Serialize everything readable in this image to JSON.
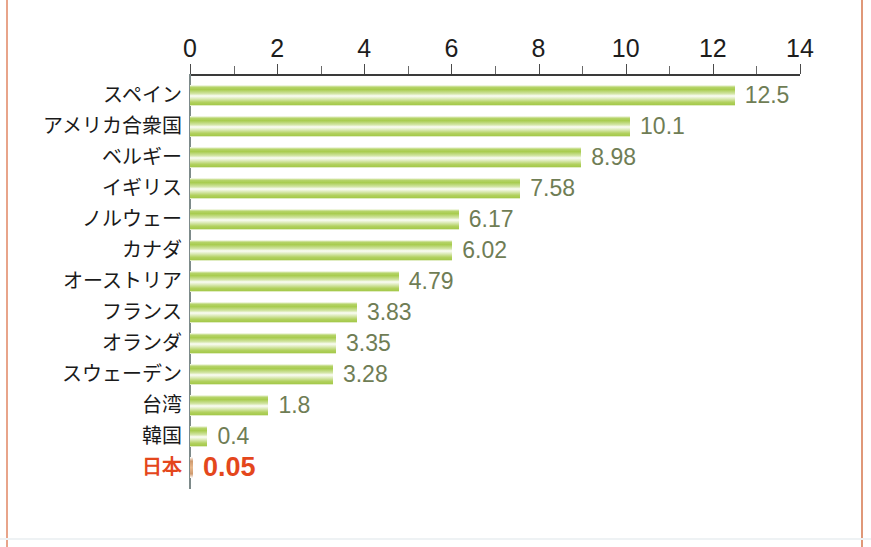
{
  "chart_data": {
    "type": "bar",
    "orientation": "horizontal",
    "title": "",
    "subtitle": "",
    "xlabel": "",
    "ylabel": "",
    "xlim": [
      0,
      14
    ],
    "xticks": [
      0,
      2,
      4,
      6,
      8,
      10,
      12,
      14
    ],
    "xtick_labels": [
      "0",
      "2",
      "4",
      "6",
      "8",
      "10",
      "12",
      "14"
    ],
    "minor_tick_interval": 1,
    "grid": false,
    "legend": "none",
    "categories": [
      "スペイン",
      "アメリカ合衆国",
      "ベルギー",
      "イギリス",
      "ノルウェー",
      "カナダ",
      "オーストリア",
      "フランス",
      "オランダ",
      "スウェーデン",
      "台湾",
      "韓国",
      "日本"
    ],
    "values": [
      12.5,
      10.1,
      8.98,
      7.58,
      6.17,
      6.02,
      4.79,
      3.83,
      3.35,
      3.28,
      1.8,
      0.4,
      0.05
    ],
    "value_labels": [
      "12.5",
      "10.1",
      "8.98",
      "7.58",
      "6.17",
      "6.02",
      "4.79",
      "3.83",
      "3.35",
      "3.28",
      "1.8",
      "0.4",
      "0.05"
    ],
    "highlight_index": 12,
    "colors": {
      "bar_green_dark": "#a8cc4f",
      "bar_green_light": "#fbfdf6",
      "value_text": "#6f7d55",
      "highlight": "#e4471c",
      "category_text": "#1a1a1a",
      "axis": "#3a3a3a",
      "frame_line": "#e8a48a",
      "background": "#ffffff"
    }
  }
}
